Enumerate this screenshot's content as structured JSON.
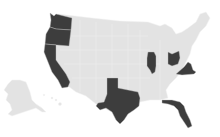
{
  "map": {
    "type": "choropleth",
    "region": "United States",
    "colors": {
      "background": "#ffffff",
      "base_state": "#e3e3e3",
      "highlighted_state": "#3d3d3d",
      "border": "#f2f2f2"
    },
    "highlighted_states": [
      "Washington",
      "Oregon",
      "California",
      "Texas",
      "Illinois",
      "Ohio",
      "Virginia",
      "Florida"
    ],
    "insets": [
      "Alaska",
      "Hawaii"
    ]
  }
}
